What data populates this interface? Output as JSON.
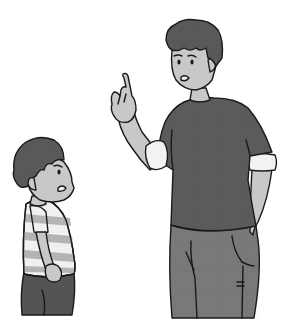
{
  "scene": {
    "description": "Grayscale illustration of a man scolding a small boy",
    "background": "#ffffff",
    "colors": {
      "outline": "#1a1a1a",
      "skin": "#c8c8c8",
      "hair": "#5a5a5a",
      "man_shirt": "#5c5c5c",
      "man_pants": "#7a7a7a",
      "cuff": "#f2f2f2",
      "boy_stripe_light": "#f0f0f0",
      "boy_stripe_dark": "#b4b4b4",
      "boy_pants": "#555555"
    },
    "figures": [
      {
        "id": "man",
        "pose": "raising index finger, admonishing",
        "expression": "stern, mouth open"
      },
      {
        "id": "boy",
        "pose": "standing with hands at sides, facing right",
        "expression": "worried, mouth open"
      }
    ]
  }
}
